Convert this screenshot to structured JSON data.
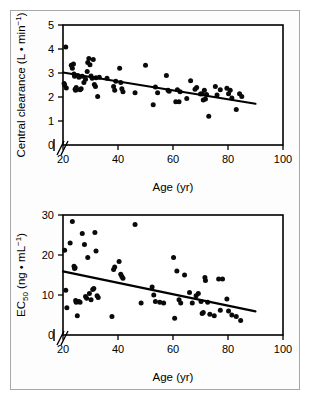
{
  "figure": {
    "background": "#ffffff",
    "border_color": "#a8a8a8",
    "point_color": "#0a0a0a",
    "line_color": "#000000"
  },
  "chart_data": [
    {
      "type": "scatter",
      "id": "central-clearance-vs-age",
      "title": "",
      "xlabel": "Age (yr)",
      "ylabel": "Central clearance (L • min⁻¹)",
      "ylabel_main": "Central clearance (L",
      "ylabel_unit_mid": " • min",
      "ylabel_unit_sup": "−1",
      "ylabel_tail": ")",
      "xlim": [
        20,
        100
      ],
      "ylim": [
        0,
        5
      ],
      "xticks": [
        20,
        40,
        60,
        80,
        100
      ],
      "yticks": [
        0,
        1,
        2,
        3,
        4,
        5
      ],
      "xtick_labels": [
        "20",
        "40",
        "60",
        "80",
        "100"
      ],
      "ytick_labels": [
        "0",
        "1",
        "2",
        "3",
        "4",
        "5"
      ],
      "axis_break": true,
      "grid": false,
      "legend": "none",
      "trendline": {
        "x": [
          20,
          90
        ],
        "y": [
          3.02,
          1.72
        ]
      },
      "points": [
        [
          21.0,
          4.08
        ],
        [
          20.4,
          2.56
        ],
        [
          20.6,
          2.5
        ],
        [
          21.2,
          2.38
        ],
        [
          23.0,
          3.32
        ],
        [
          23.4,
          3.2
        ],
        [
          23.8,
          3.38
        ],
        [
          24.0,
          2.96
        ],
        [
          24.2,
          2.86
        ],
        [
          24.4,
          2.32
        ],
        [
          24.6,
          2.28
        ],
        [
          24.8,
          2.4
        ],
        [
          25.4,
          2.9
        ],
        [
          25.8,
          2.82
        ],
        [
          26.2,
          2.3
        ],
        [
          26.6,
          2.34
        ],
        [
          27.0,
          2.86
        ],
        [
          27.6,
          2.6
        ],
        [
          28.2,
          2.74
        ],
        [
          28.8,
          3.06
        ],
        [
          29.0,
          3.44
        ],
        [
          29.4,
          3.6
        ],
        [
          29.8,
          3.34
        ],
        [
          30.2,
          2.88
        ],
        [
          30.6,
          2.78
        ],
        [
          31.0,
          3.56
        ],
        [
          31.4,
          2.52
        ],
        [
          31.8,
          2.44
        ],
        [
          32.0,
          2.8
        ],
        [
          32.6,
          2.02
        ],
        [
          33.2,
          2.82
        ],
        [
          36.0,
          2.78
        ],
        [
          38.4,
          2.44
        ],
        [
          38.8,
          2.28
        ],
        [
          39.2,
          2.66
        ],
        [
          40.6,
          3.2
        ],
        [
          41.0,
          2.6
        ],
        [
          41.4,
          2.34
        ],
        [
          41.8,
          2.22
        ],
        [
          46.2,
          2.18
        ],
        [
          50.0,
          3.32
        ],
        [
          52.8,
          1.68
        ],
        [
          53.6,
          2.42
        ],
        [
          54.4,
          2.18
        ],
        [
          57.6,
          2.9
        ],
        [
          58.2,
          2.28
        ],
        [
          58.6,
          2.24
        ],
        [
          61.0,
          1.8
        ],
        [
          61.6,
          2.3
        ],
        [
          62.2,
          1.8
        ],
        [
          62.6,
          2.22
        ],
        [
          65.0,
          1.94
        ],
        [
          66.4,
          2.68
        ],
        [
          68.0,
          2.32
        ],
        [
          68.6,
          2.4
        ],
        [
          70.0,
          2.12
        ],
        [
          70.6,
          2.14
        ],
        [
          71.0,
          1.88
        ],
        [
          71.4,
          2.28
        ],
        [
          71.8,
          1.92
        ],
        [
          72.2,
          2.1
        ],
        [
          73.0,
          1.2
        ],
        [
          75.4,
          2.44
        ],
        [
          76.0,
          2.08
        ],
        [
          77.2,
          2.3
        ],
        [
          79.6,
          2.36
        ],
        [
          80.2,
          2.14
        ],
        [
          80.8,
          2.28
        ],
        [
          81.4,
          1.96
        ],
        [
          83.0,
          1.48
        ],
        [
          84.2,
          2.14
        ],
        [
          85.0,
          2.02
        ]
      ]
    },
    {
      "type": "scatter",
      "id": "ec50-vs-age",
      "title": "",
      "xlabel": "Age (yr)",
      "ylabel": "EC₅₀ (ng • mL⁻¹)",
      "ylabel_main": "EC",
      "ylabel_sub": "50",
      "ylabel_unit_mid": " (ng • mL",
      "ylabel_unit_sup": "−1",
      "ylabel_tail": ")",
      "xlim": [
        20,
        100
      ],
      "ylim": [
        0,
        30
      ],
      "xticks": [
        20,
        40,
        60,
        80,
        100
      ],
      "yticks": [
        0,
        10,
        20,
        30
      ],
      "xtick_labels": [
        "20",
        "40",
        "60",
        "80",
        "100"
      ],
      "ytick_labels": [
        "0",
        "10",
        "20",
        "30"
      ],
      "axis_break": true,
      "grid": false,
      "legend": "none",
      "trendline": {
        "x": [
          20,
          90
        ],
        "y": [
          15.9,
          5.9
        ]
      },
      "points": [
        [
          20.6,
          21.2
        ],
        [
          21.0,
          11.2
        ],
        [
          21.4,
          6.8
        ],
        [
          22.6,
          23.0
        ],
        [
          23.4,
          28.4
        ],
        [
          24.0,
          17.2
        ],
        [
          24.2,
          16.6
        ],
        [
          24.4,
          16.8
        ],
        [
          24.6,
          8.6
        ],
        [
          24.8,
          8.2
        ],
        [
          25.2,
          4.8
        ],
        [
          25.8,
          8.4
        ],
        [
          26.2,
          8.2
        ],
        [
          27.0,
          25.4
        ],
        [
          27.8,
          22.6
        ],
        [
          28.2,
          9.6
        ],
        [
          28.6,
          9.2
        ],
        [
          29.0,
          19.4
        ],
        [
          29.6,
          10.4
        ],
        [
          30.2,
          8.8
        ],
        [
          30.8,
          11.4
        ],
        [
          31.2,
          11.6
        ],
        [
          31.6,
          25.6
        ],
        [
          32.0,
          21.0
        ],
        [
          32.4,
          9.8
        ],
        [
          32.8,
          9.4
        ],
        [
          37.8,
          4.6
        ],
        [
          38.4,
          16.4
        ],
        [
          38.8,
          17.0
        ],
        [
          40.4,
          18.4
        ],
        [
          41.0,
          15.2
        ],
        [
          41.4,
          14.6
        ],
        [
          41.8,
          14.2
        ],
        [
          46.2,
          27.6
        ],
        [
          48.4,
          8.0
        ],
        [
          52.4,
          12.0
        ],
        [
          53.0,
          10.0
        ],
        [
          53.6,
          8.4
        ],
        [
          55.2,
          8.2
        ],
        [
          56.6,
          8.0
        ],
        [
          60.2,
          19.4
        ],
        [
          60.6,
          4.2
        ],
        [
          61.4,
          16.0
        ],
        [
          62.2,
          8.8
        ],
        [
          62.8,
          8.0
        ],
        [
          64.2,
          15.0
        ],
        [
          66.0,
          10.6
        ],
        [
          67.0,
          8.0
        ],
        [
          68.4,
          9.8
        ],
        [
          69.2,
          10.4
        ],
        [
          70.2,
          8.4
        ],
        [
          70.6,
          5.4
        ],
        [
          71.0,
          5.6
        ],
        [
          71.6,
          14.4
        ],
        [
          71.8,
          13.6
        ],
        [
          72.6,
          8.2
        ],
        [
          73.4,
          5.2
        ],
        [
          75.0,
          4.8
        ],
        [
          76.6,
          14.0
        ],
        [
          77.2,
          6.2
        ],
        [
          78.0,
          14.0
        ],
        [
          79.6,
          9.0
        ],
        [
          80.2,
          6.0
        ],
        [
          81.4,
          5.0
        ],
        [
          83.0,
          4.6
        ],
        [
          84.6,
          3.6
        ]
      ]
    }
  ]
}
